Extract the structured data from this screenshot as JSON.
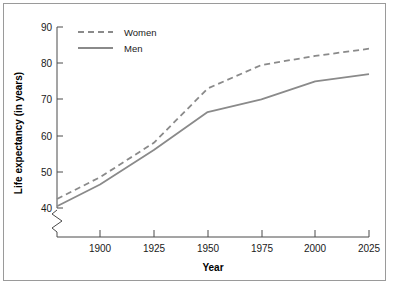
{
  "chart_data": {
    "type": "line",
    "title": "",
    "xlabel": "Year",
    "ylabel": "Life expectancy (in years)",
    "xlim": [
      1880,
      2025
    ],
    "ylim": [
      38,
      90
    ],
    "grid": false,
    "axis_break": true,
    "axis_break_note": "y-axis broken below 40",
    "legend_position": "top-left inside plot",
    "xticks": [
      1900,
      1925,
      1950,
      1975,
      2000,
      2025
    ],
    "xtick_labels": [
      "1900",
      "1925",
      "1950",
      "1975",
      "2000",
      "2025"
    ],
    "yticks": [
      40,
      50,
      60,
      70,
      80,
      90
    ],
    "ytick_labels": [
      "40",
      "50",
      "60",
      "70",
      "80",
      "90"
    ],
    "x": [
      1880,
      1900,
      1925,
      1950,
      1975,
      2000,
      2025
    ],
    "series": [
      {
        "name": "Women",
        "style": "dashed",
        "color": "#8a8a8a",
        "values": [
          42.5,
          48.5,
          58.0,
          73.0,
          79.5,
          82.0,
          84.0
        ]
      },
      {
        "name": "Men",
        "style": "solid",
        "color": "#8a8a8a",
        "values": [
          40.5,
          46.5,
          56.0,
          66.5,
          70.0,
          75.0,
          77.0
        ]
      }
    ]
  },
  "figure": {
    "frame_color": "#9a9a9a",
    "background": "#ffffff",
    "axis_color": "#4a4a4a"
  }
}
